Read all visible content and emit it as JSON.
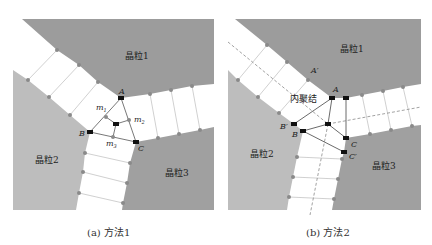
{
  "colors": {
    "grain1": "#9c9c9c",
    "grain2": "#bdbdbd",
    "grain3": "#a0a0a0",
    "grey_node": "#8a8a8a",
    "black_node": "#111111",
    "gb_line": "#c8c8c8"
  },
  "panel_a": {
    "caption": "(a) 方法1",
    "grain1_label": "晶粒1",
    "grain2_label": "晶粒2",
    "grain3_label": "晶粒3",
    "node_A": "A",
    "node_B": "B",
    "node_C": "C",
    "m1": "m",
    "m1_sub": "1",
    "m2": "m",
    "m2_sub": "2",
    "m3": "m",
    "m3_sub": "3"
  },
  "panel_b": {
    "caption": "(b) 方法2",
    "grain1_label": "晶粒1",
    "grain2_label": "晶粒2",
    "grain3_label": "晶粒3",
    "junction_label": "内聚结",
    "node_A": "A",
    "node_A_prime": "A′",
    "node_B": "B",
    "node_B_prime": "B′",
    "node_C": "C",
    "node_C_prime": "C′"
  }
}
